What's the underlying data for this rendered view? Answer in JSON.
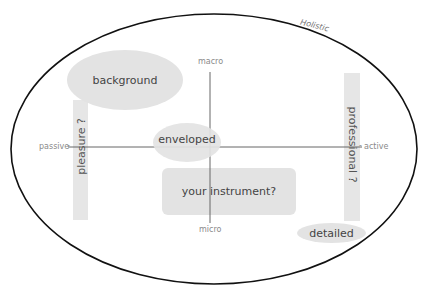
{
  "diagram": {
    "outer_label": "Holistic",
    "axes": {
      "top": "macro",
      "bottom": "micro",
      "left": "passive",
      "right": "active"
    },
    "nodes": {
      "background": "background",
      "enveloped": "enveloped",
      "instrument": "your instrument?",
      "detailed": "detailed",
      "pleasure": "pleasure ?",
      "professional": "professional ?"
    },
    "colors": {
      "outline": "#111111",
      "axis": "#666666",
      "shape_fill": "#e3e3e3",
      "label_text": "#8a8a8a",
      "node_text": "#444444"
    }
  }
}
